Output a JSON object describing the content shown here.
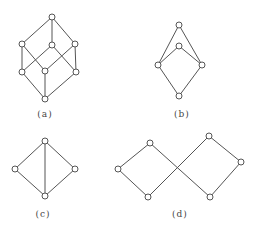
{
  "figures": [
    {
      "id": "a",
      "caption": "(a)",
      "caption_pos": [
        45,
        114
      ],
      "nodes": [
        [
          52,
          17
        ],
        [
          22,
          44
        ],
        [
          52,
          45
        ],
        [
          75,
          44
        ],
        [
          22,
          72
        ],
        [
          45,
          71
        ],
        [
          76,
          72
        ],
        [
          45,
          99
        ]
      ],
      "edges": [
        [
          0,
          1
        ],
        [
          0,
          2
        ],
        [
          0,
          3
        ],
        [
          1,
          4
        ],
        [
          1,
          5
        ],
        [
          2,
          4
        ],
        [
          2,
          6
        ],
        [
          3,
          5
        ],
        [
          3,
          6
        ],
        [
          4,
          7
        ],
        [
          5,
          7
        ],
        [
          6,
          7
        ]
      ]
    },
    {
      "id": "b",
      "caption": "(b)",
      "caption_pos": [
        182,
        114
      ],
      "nodes": [
        [
          179,
          25
        ],
        [
          179,
          46
        ],
        [
          158,
          65
        ],
        [
          202,
          65
        ],
        [
          179,
          96
        ]
      ],
      "edges": [
        [
          0,
          2
        ],
        [
          0,
          3
        ],
        [
          1,
          2
        ],
        [
          1,
          3
        ],
        [
          2,
          4
        ],
        [
          3,
          4
        ]
      ]
    },
    {
      "id": "c",
      "caption": "(c)",
      "caption_pos": [
        43,
        214
      ],
      "nodes": [
        [
          45,
          141
        ],
        [
          15,
          169
        ],
        [
          75,
          169
        ],
        [
          45,
          196
        ]
      ],
      "edges": [
        [
          0,
          1
        ],
        [
          0,
          2
        ],
        [
          0,
          3
        ],
        [
          1,
          3
        ],
        [
          2,
          3
        ]
      ]
    },
    {
      "id": "d",
      "caption": "(d)",
      "caption_pos": [
        180,
        214
      ],
      "nodes": [
        [
          150,
          143
        ],
        [
          118,
          169
        ],
        [
          148,
          197
        ],
        [
          209,
          136
        ],
        [
          241,
          162
        ],
        [
          210,
          197
        ]
      ],
      "edges": [
        [
          1,
          0
        ],
        [
          1,
          2
        ],
        [
          0,
          5
        ],
        [
          2,
          3
        ],
        [
          3,
          4
        ],
        [
          4,
          5
        ]
      ]
    }
  ],
  "style": {
    "line_color": "#555555",
    "node_fill": "#ffffff",
    "node_radius": 3
  }
}
